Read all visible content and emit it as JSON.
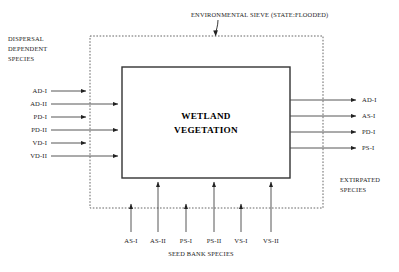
{
  "diagram": {
    "title_annotation": "ENVIRONMENTAL SIEVE (STATE:FLOODED)",
    "center_box": {
      "line1": "WETLAND",
      "line2": "VEGETATION"
    },
    "left_group_label": {
      "line1": "DISPERSAL",
      "line2": "DEPENDENT",
      "line3": "SPECIES"
    },
    "right_group_label": {
      "line1": "EXTIRPATED",
      "line2": "SPECIES"
    },
    "bottom_group_label": "SEED BANK SPECIES",
    "inputs_left": [
      {
        "label": "AD-I",
        "passes_sieve": false
      },
      {
        "label": "AD-II",
        "passes_sieve": true
      },
      {
        "label": "PD-I",
        "passes_sieve": false
      },
      {
        "label": "PD-II",
        "passes_sieve": true
      },
      {
        "label": "VD-I",
        "passes_sieve": false
      },
      {
        "label": "VD-II",
        "passes_sieve": true
      }
    ],
    "inputs_bottom": [
      {
        "label": "AS-I",
        "passes_sieve": false
      },
      {
        "label": "AS-II",
        "passes_sieve": true
      },
      {
        "label": "PS-I",
        "passes_sieve": false
      },
      {
        "label": "PS-II",
        "passes_sieve": true
      },
      {
        "label": "VS-I",
        "passes_sieve": false
      },
      {
        "label": "VS-II",
        "passes_sieve": true
      }
    ],
    "outputs_right": [
      {
        "label": "AD-I"
      },
      {
        "label": "AS-I"
      },
      {
        "label": "PD-I"
      },
      {
        "label": "PS-I"
      }
    ],
    "colors": {
      "background": "#ffffff",
      "line": "#444444",
      "box_stroke": "#333333",
      "sieve_stroke": "#555555",
      "text": "#1a1a1a"
    }
  }
}
